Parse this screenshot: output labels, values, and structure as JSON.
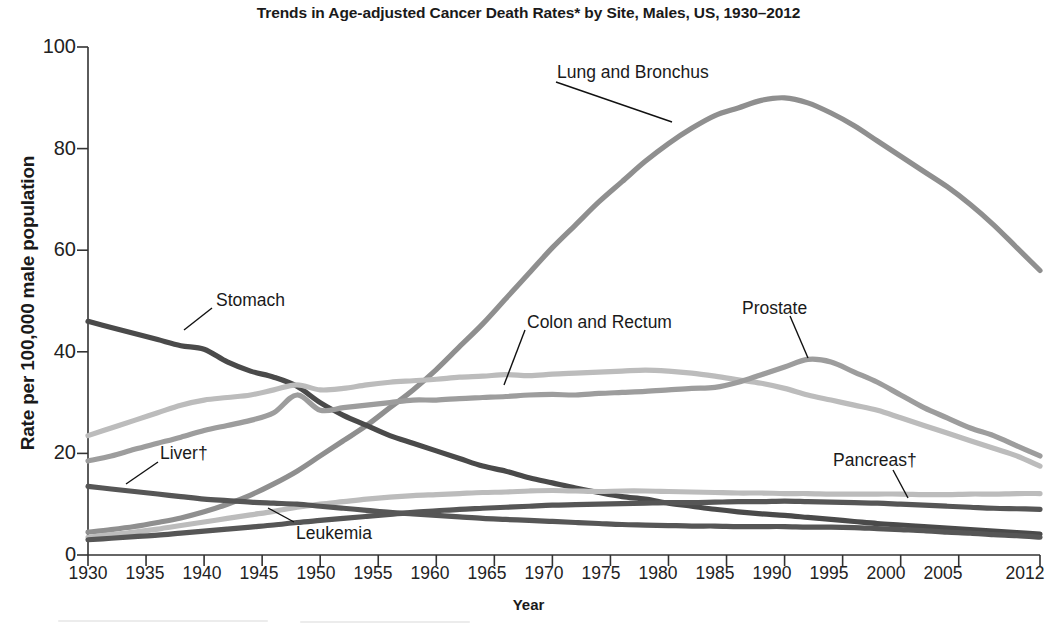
{
  "chart_data": {
    "type": "line",
    "title": "Trends in Age-adjusted Cancer Death Rates* by Site, Males, US, 1930–2012",
    "xlabel": "Year",
    "ylabel": "Rate per 100,000 male population",
    "xlim": [
      1930,
      2012
    ],
    "ylim": [
      0,
      100
    ],
    "grid": false,
    "legend": "inline-annotations",
    "ytick_labels": [
      "0",
      "20",
      "40",
      "60",
      "80",
      "100"
    ],
    "ytick_values": [
      0,
      20,
      40,
      60,
      80,
      100
    ],
    "xtick_labels": [
      "1930",
      "1935",
      "1940",
      "1945",
      "1950",
      "1955",
      "1960",
      "1965",
      "1970",
      "1975",
      "1980",
      "1985",
      "1990",
      "1995",
      "2000",
      "2005",
      "2012"
    ],
    "xtick_values": [
      1930,
      1935,
      1940,
      1945,
      1950,
      1955,
      1960,
      1965,
      1970,
      1975,
      1980,
      1985,
      1990,
      1995,
      2000,
      2005,
      2012
    ],
    "x": [
      1930,
      1932,
      1934,
      1936,
      1938,
      1940,
      1942,
      1944,
      1946,
      1948,
      1950,
      1952,
      1954,
      1956,
      1958,
      1960,
      1962,
      1964,
      1966,
      1968,
      1970,
      1972,
      1974,
      1976,
      1978,
      1980,
      1982,
      1984,
      1986,
      1988,
      1990,
      1992,
      1994,
      1996,
      1998,
      2000,
      2002,
      2004,
      2006,
      2008,
      2010,
      2012
    ],
    "series": [
      {
        "name": "Lung and Bronchus",
        "color": "#8f8f8f",
        "label": "Lung and Bronchus",
        "values": [
          4.5,
          5.0,
          5.6,
          6.4,
          7.3,
          8.5,
          10.0,
          11.8,
          14.0,
          16.5,
          19.5,
          22.5,
          25.5,
          29.0,
          32.5,
          36.5,
          41.0,
          45.5,
          50.5,
          55.5,
          60.5,
          65.0,
          69.5,
          73.5,
          77.5,
          81.0,
          84.0,
          86.5,
          88.0,
          89.5,
          90.0,
          89.0,
          87.0,
          84.5,
          81.5,
          78.5,
          75.5,
          72.5,
          69.0,
          65.0,
          60.5,
          56.0
        ]
      },
      {
        "name": "Stomach",
        "color": "#4a4a4a",
        "label": "Stomach",
        "values": [
          46.0,
          44.8,
          43.6,
          42.4,
          41.2,
          40.5,
          38.0,
          36.2,
          35.0,
          33.2,
          30.0,
          27.5,
          25.5,
          23.5,
          22.0,
          20.5,
          19.0,
          17.5,
          16.5,
          15.2,
          14.2,
          13.2,
          12.3,
          11.5,
          11.0,
          10.2,
          9.6,
          9.0,
          8.5,
          8.1,
          7.8,
          7.4,
          7.0,
          6.6,
          6.2,
          5.9,
          5.6,
          5.3,
          5.0,
          4.7,
          4.4,
          4.1
        ]
      },
      {
        "name": "Colon and Rectum",
        "color": "#bcbcbc",
        "label": "Colon and Rectum",
        "values": [
          23.5,
          25.0,
          26.5,
          28.0,
          29.5,
          30.5,
          31.0,
          31.5,
          32.5,
          33.5,
          32.5,
          32.8,
          33.5,
          34.0,
          34.3,
          34.6,
          35.0,
          35.2,
          35.5,
          35.3,
          35.6,
          35.8,
          36.0,
          36.2,
          36.4,
          36.2,
          35.8,
          35.2,
          34.5,
          33.8,
          32.8,
          31.5,
          30.5,
          29.5,
          28.5,
          27.0,
          25.5,
          24.0,
          22.5,
          21.0,
          19.5,
          17.5
        ]
      },
      {
        "name": "Prostate",
        "color": "#9d9d9d",
        "label": "Prostate",
        "values": [
          18.5,
          19.5,
          20.8,
          22.0,
          23.2,
          24.5,
          25.5,
          26.5,
          28.0,
          31.5,
          28.5,
          29.0,
          29.5,
          30.0,
          30.5,
          30.5,
          30.8,
          31.0,
          31.2,
          31.5,
          31.6,
          31.5,
          31.8,
          32.0,
          32.2,
          32.5,
          32.8,
          33.0,
          34.0,
          35.5,
          37.0,
          38.5,
          38.0,
          36.0,
          34.0,
          31.5,
          29.0,
          27.0,
          25.0,
          23.5,
          21.5,
          19.5
        ]
      },
      {
        "name": "Pancreas",
        "color": "#bcbcbc",
        "label": "Pancreas†",
        "values": [
          3.5,
          4.0,
          4.5,
          5.1,
          5.8,
          6.5,
          7.2,
          7.9,
          8.6,
          9.4,
          10.0,
          10.5,
          11.0,
          11.4,
          11.7,
          11.9,
          12.1,
          12.3,
          12.4,
          12.6,
          12.7,
          12.6,
          12.5,
          12.6,
          12.6,
          12.5,
          12.4,
          12.3,
          12.2,
          12.2,
          12.1,
          12.1,
          12.0,
          12.0,
          12.0,
          12.0,
          11.9,
          11.9,
          12.0,
          12.0,
          12.1,
          12.1
        ]
      },
      {
        "name": "Liver",
        "color": "#565656",
        "label": "Liver†",
        "values": [
          13.5,
          13.0,
          12.5,
          12.0,
          11.5,
          11.0,
          10.7,
          10.4,
          10.2,
          10.0,
          9.6,
          9.2,
          8.8,
          8.4,
          8.1,
          7.8,
          7.5,
          7.2,
          7.0,
          6.8,
          6.6,
          6.4,
          6.2,
          6.0,
          5.9,
          5.8,
          5.7,
          5.7,
          5.6,
          5.6,
          5.6,
          5.5,
          5.5,
          5.4,
          5.2,
          5.0,
          4.8,
          4.5,
          4.3,
          4.0,
          3.8,
          3.5
        ]
      },
      {
        "name": "Leukemia",
        "color": "#565656",
        "label": "Leukemia",
        "values": [
          3.0,
          3.3,
          3.6,
          3.9,
          4.3,
          4.7,
          5.1,
          5.5,
          5.9,
          6.4,
          6.8,
          7.2,
          7.6,
          8.0,
          8.4,
          8.7,
          9.0,
          9.2,
          9.4,
          9.6,
          9.8,
          9.9,
          10.0,
          10.1,
          10.2,
          10.3,
          10.3,
          10.4,
          10.5,
          10.5,
          10.6,
          10.5,
          10.4,
          10.3,
          10.2,
          10.0,
          9.8,
          9.6,
          9.4,
          9.2,
          9.1,
          9.0
        ]
      }
    ],
    "annotations": [
      {
        "text": "Lung and Bronchus",
        "x": 557,
        "y": 62,
        "leader": [
          [
            556,
            82
          ],
          [
            672,
            122
          ]
        ]
      },
      {
        "text": "Stomach",
        "x": 216,
        "y": 290,
        "leader": [
          [
            212,
            308
          ],
          [
            184,
            330
          ]
        ]
      },
      {
        "text": "Colon and Rectum",
        "x": 527,
        "y": 312,
        "leader": [
          [
            525,
            330
          ],
          [
            504,
            385
          ]
        ]
      },
      {
        "text": "Prostate",
        "x": 742,
        "y": 298,
        "leader": [
          [
            790,
            316
          ],
          [
            808,
            358
          ]
        ]
      },
      {
        "text": "Liver†",
        "x": 160,
        "y": 443,
        "leader": [
          [
            158,
            462
          ],
          [
            126,
            484
          ]
        ]
      },
      {
        "text": "Leukemia",
        "x": 296,
        "y": 523,
        "leader": [
          [
            294,
            522
          ],
          [
            268,
            508
          ]
        ]
      },
      {
        "text": "Pancreas†",
        "x": 833,
        "y": 450,
        "leader": [
          [
            893,
            470
          ],
          [
            908,
            498
          ]
        ]
      }
    ]
  },
  "axis": {
    "title": "Trends in Age-adjusted Cancer Death Rates* by Site, Males, US, 1930–2012",
    "x_axis_title": "Year",
    "y_axis_title": "Rate per 100,000 male population"
  }
}
